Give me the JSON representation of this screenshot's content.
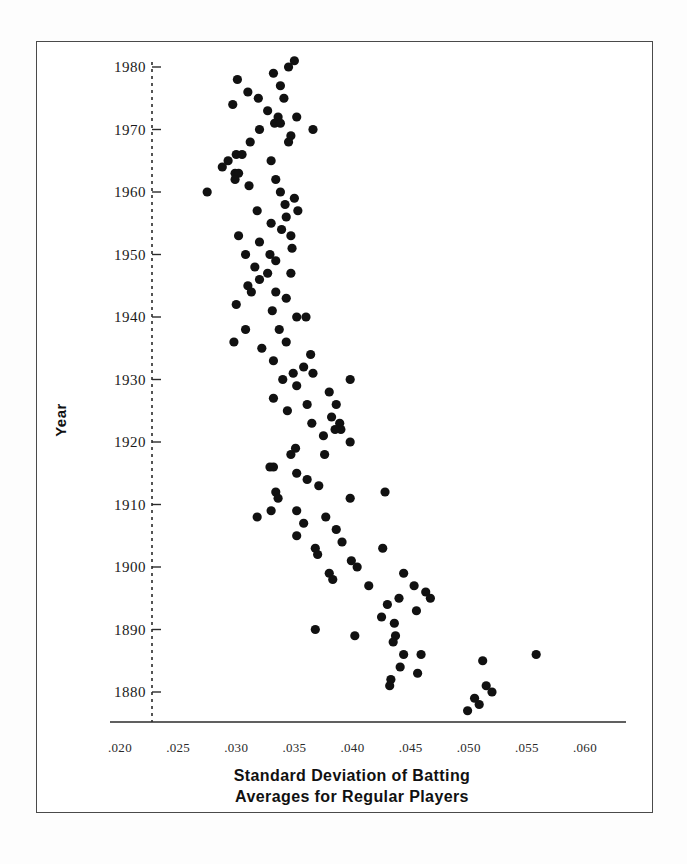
{
  "figure": {
    "background_color": "#ffffff",
    "frame_color": "#4a4a4a",
    "marker_color": "#111111"
  },
  "axis": {
    "y_label": "Year",
    "x_title_line1": "Standard Deviation of Batting",
    "x_title_line2": "Averages for Regular Players",
    "x_ticks": [
      ".020",
      ".025",
      ".030",
      ".035",
      ".040",
      ".045",
      ".050",
      ".055",
      ".060"
    ],
    "y_ticks": [
      "1980",
      "1970",
      "1960",
      "1950",
      "1940",
      "1930",
      "1920",
      "1910",
      "1900",
      "1890",
      "1880"
    ]
  },
  "chart_data": {
    "type": "scatter",
    "title": "",
    "xlabel": "Standard Deviation of Batting Averages for Regular Players",
    "ylabel": "Year",
    "xlim": [
      0.019,
      0.0605
    ],
    "ylim": [
      1874,
      1982
    ],
    "xtick_values": [
      0.02,
      0.025,
      0.03,
      0.035,
      0.04,
      0.045,
      0.05,
      0.055,
      0.06
    ],
    "ytick_values": [
      1980,
      1970,
      1960,
      1950,
      1940,
      1930,
      1920,
      1910,
      1900,
      1890,
      1880
    ],
    "grid": false,
    "legend": false,
    "x_name": "Standard Deviation of Batting Averages",
    "y_name": "Year",
    "points": [
      {
        "x": 0.035,
        "y": 1981
      },
      {
        "x": 0.0332,
        "y": 1979
      },
      {
        "x": 0.0301,
        "y": 1978
      },
      {
        "x": 0.0345,
        "y": 1980
      },
      {
        "x": 0.0338,
        "y": 1977
      },
      {
        "x": 0.031,
        "y": 1976
      },
      {
        "x": 0.0319,
        "y": 1975
      },
      {
        "x": 0.0341,
        "y": 1975
      },
      {
        "x": 0.0297,
        "y": 1974
      },
      {
        "x": 0.0327,
        "y": 1973
      },
      {
        "x": 0.0336,
        "y": 1972
      },
      {
        "x": 0.0352,
        "y": 1972
      },
      {
        "x": 0.0333,
        "y": 1971
      },
      {
        "x": 0.0338,
        "y": 1971
      },
      {
        "x": 0.0366,
        "y": 1970
      },
      {
        "x": 0.032,
        "y": 1970
      },
      {
        "x": 0.0347,
        "y": 1969
      },
      {
        "x": 0.0312,
        "y": 1968
      },
      {
        "x": 0.0345,
        "y": 1968
      },
      {
        "x": 0.03,
        "y": 1966
      },
      {
        "x": 0.0305,
        "y": 1966
      },
      {
        "x": 0.0293,
        "y": 1965
      },
      {
        "x": 0.033,
        "y": 1965
      },
      {
        "x": 0.0288,
        "y": 1964
      },
      {
        "x": 0.0299,
        "y": 1963
      },
      {
        "x": 0.0302,
        "y": 1963
      },
      {
        "x": 0.0299,
        "y": 1962
      },
      {
        "x": 0.0334,
        "y": 1962
      },
      {
        "x": 0.0275,
        "y": 1960
      },
      {
        "x": 0.0311,
        "y": 1961
      },
      {
        "x": 0.0338,
        "y": 1960
      },
      {
        "x": 0.035,
        "y": 1959
      },
      {
        "x": 0.0342,
        "y": 1958
      },
      {
        "x": 0.0318,
        "y": 1957
      },
      {
        "x": 0.0353,
        "y": 1957
      },
      {
        "x": 0.0343,
        "y": 1956
      },
      {
        "x": 0.033,
        "y": 1955
      },
      {
        "x": 0.0339,
        "y": 1954
      },
      {
        "x": 0.0347,
        "y": 1953
      },
      {
        "x": 0.0302,
        "y": 1953
      },
      {
        "x": 0.032,
        "y": 1952
      },
      {
        "x": 0.0348,
        "y": 1951
      },
      {
        "x": 0.0308,
        "y": 1950
      },
      {
        "x": 0.0329,
        "y": 1950
      },
      {
        "x": 0.0334,
        "y": 1949
      },
      {
        "x": 0.0316,
        "y": 1948
      },
      {
        "x": 0.0327,
        "y": 1947
      },
      {
        "x": 0.0347,
        "y": 1947
      },
      {
        "x": 0.032,
        "y": 1946
      },
      {
        "x": 0.031,
        "y": 1945
      },
      {
        "x": 0.0313,
        "y": 1944
      },
      {
        "x": 0.0334,
        "y": 1944
      },
      {
        "x": 0.0343,
        "y": 1943
      },
      {
        "x": 0.03,
        "y": 1942
      },
      {
        "x": 0.0331,
        "y": 1941
      },
      {
        "x": 0.0352,
        "y": 1940
      },
      {
        "x": 0.036,
        "y": 1940
      },
      {
        "x": 0.0308,
        "y": 1938
      },
      {
        "x": 0.0337,
        "y": 1938
      },
      {
        "x": 0.0298,
        "y": 1936
      },
      {
        "x": 0.0343,
        "y": 1936
      },
      {
        "x": 0.0322,
        "y": 1935
      },
      {
        "x": 0.0364,
        "y": 1934
      },
      {
        "x": 0.0332,
        "y": 1933
      },
      {
        "x": 0.0358,
        "y": 1932
      },
      {
        "x": 0.0349,
        "y": 1931
      },
      {
        "x": 0.0366,
        "y": 1931
      },
      {
        "x": 0.034,
        "y": 1930
      },
      {
        "x": 0.0398,
        "y": 1930
      },
      {
        "x": 0.0352,
        "y": 1929
      },
      {
        "x": 0.038,
        "y": 1928
      },
      {
        "x": 0.0332,
        "y": 1927
      },
      {
        "x": 0.0361,
        "y": 1926
      },
      {
        "x": 0.0386,
        "y": 1926
      },
      {
        "x": 0.0344,
        "y": 1925
      },
      {
        "x": 0.0382,
        "y": 1924
      },
      {
        "x": 0.0389,
        "y": 1923
      },
      {
        "x": 0.0365,
        "y": 1923
      },
      {
        "x": 0.039,
        "y": 1922
      },
      {
        "x": 0.0385,
        "y": 1922
      },
      {
        "x": 0.0375,
        "y": 1921
      },
      {
        "x": 0.0398,
        "y": 1920
      },
      {
        "x": 0.0351,
        "y": 1919
      },
      {
        "x": 0.0347,
        "y": 1918
      },
      {
        "x": 0.0376,
        "y": 1918
      },
      {
        "x": 0.0329,
        "y": 1916
      },
      {
        "x": 0.0332,
        "y": 1916
      },
      {
        "x": 0.0352,
        "y": 1915
      },
      {
        "x": 0.0361,
        "y": 1914
      },
      {
        "x": 0.0371,
        "y": 1913
      },
      {
        "x": 0.0334,
        "y": 1912
      },
      {
        "x": 0.0336,
        "y": 1911
      },
      {
        "x": 0.0428,
        "y": 1912
      },
      {
        "x": 0.0398,
        "y": 1911
      },
      {
        "x": 0.033,
        "y": 1909
      },
      {
        "x": 0.0352,
        "y": 1909
      },
      {
        "x": 0.0377,
        "y": 1908
      },
      {
        "x": 0.0318,
        "y": 1908
      },
      {
        "x": 0.0358,
        "y": 1907
      },
      {
        "x": 0.0386,
        "y": 1906
      },
      {
        "x": 0.0352,
        "y": 1905
      },
      {
        "x": 0.0391,
        "y": 1904
      },
      {
        "x": 0.0368,
        "y": 1903
      },
      {
        "x": 0.0426,
        "y": 1903
      },
      {
        "x": 0.037,
        "y": 1902
      },
      {
        "x": 0.0399,
        "y": 1901
      },
      {
        "x": 0.0404,
        "y": 1900
      },
      {
        "x": 0.038,
        "y": 1899
      },
      {
        "x": 0.0383,
        "y": 1898
      },
      {
        "x": 0.0444,
        "y": 1899
      },
      {
        "x": 0.0414,
        "y": 1897
      },
      {
        "x": 0.0453,
        "y": 1897
      },
      {
        "x": 0.0463,
        "y": 1896
      },
      {
        "x": 0.044,
        "y": 1895
      },
      {
        "x": 0.0467,
        "y": 1895
      },
      {
        "x": 0.043,
        "y": 1894
      },
      {
        "x": 0.0455,
        "y": 1893
      },
      {
        "x": 0.0425,
        "y": 1892
      },
      {
        "x": 0.0436,
        "y": 1891
      },
      {
        "x": 0.0368,
        "y": 1890
      },
      {
        "x": 0.0402,
        "y": 1889
      },
      {
        "x": 0.0437,
        "y": 1889
      },
      {
        "x": 0.0435,
        "y": 1888
      },
      {
        "x": 0.0558,
        "y": 1886
      },
      {
        "x": 0.0444,
        "y": 1886
      },
      {
        "x": 0.0459,
        "y": 1886
      },
      {
        "x": 0.0512,
        "y": 1885
      },
      {
        "x": 0.0441,
        "y": 1884
      },
      {
        "x": 0.0456,
        "y": 1883
      },
      {
        "x": 0.0433,
        "y": 1882
      },
      {
        "x": 0.0432,
        "y": 1881
      },
      {
        "x": 0.0515,
        "y": 1881
      },
      {
        "x": 0.052,
        "y": 1880
      },
      {
        "x": 0.0505,
        "y": 1879
      },
      {
        "x": 0.0509,
        "y": 1878
      },
      {
        "x": 0.0499,
        "y": 1877
      }
    ]
  }
}
